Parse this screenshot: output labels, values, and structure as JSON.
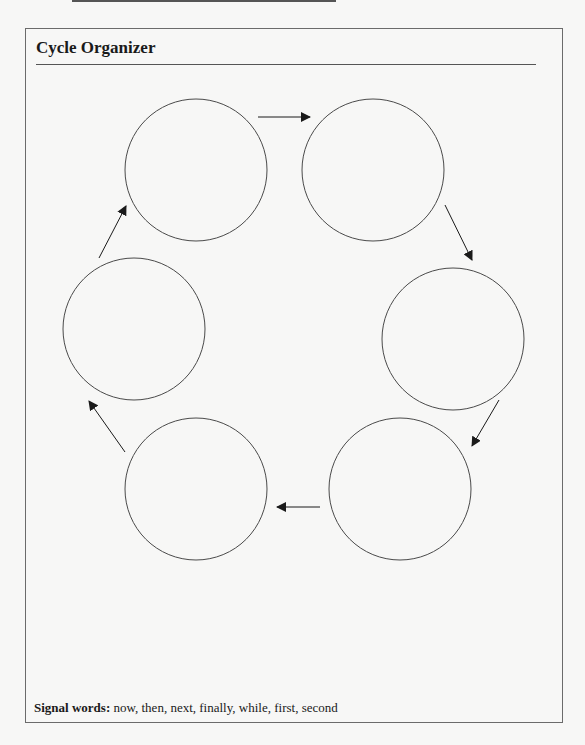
{
  "title": "Cycle Organizer",
  "footer": {
    "label": "Signal words:",
    "words": " now, then, next, finally, while, first, second"
  },
  "diagram": {
    "circles": [
      {
        "id": 1,
        "cx": 196,
        "cy": 170,
        "r": 71,
        "text": ""
      },
      {
        "id": 2,
        "cx": 373,
        "cy": 170,
        "r": 71,
        "text": ""
      },
      {
        "id": 3,
        "cx": 453,
        "cy": 339,
        "r": 71,
        "text": ""
      },
      {
        "id": 4,
        "cx": 400,
        "cy": 489,
        "r": 71,
        "text": ""
      },
      {
        "id": 5,
        "cx": 196,
        "cy": 489,
        "r": 71,
        "text": ""
      },
      {
        "id": 6,
        "cx": 134,
        "cy": 329,
        "r": 71,
        "text": ""
      }
    ],
    "arrows": [
      {
        "from": 1,
        "to": 2,
        "x1": 258,
        "y1": 117,
        "x2": 310,
        "y2": 117
      },
      {
        "from": 2,
        "to": 3,
        "x1": 445,
        "y1": 205,
        "x2": 472,
        "y2": 260
      },
      {
        "from": 3,
        "to": 4,
        "x1": 499,
        "y1": 400,
        "x2": 472,
        "y2": 446
      },
      {
        "from": 4,
        "to": 5,
        "x1": 320,
        "y1": 507,
        "x2": 277,
        "y2": 507
      },
      {
        "from": 5,
        "to": 6,
        "x1": 125,
        "y1": 452,
        "x2": 89,
        "y2": 401
      },
      {
        "from": 6,
        "to": 1,
        "x1": 99,
        "y1": 258,
        "x2": 126,
        "y2": 206
      }
    ],
    "stroke_color": "#4a4a4a",
    "arrow_color": "#1a1a1a"
  }
}
